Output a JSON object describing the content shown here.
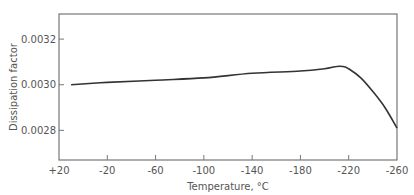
{
  "chart_data": {
    "type": "line",
    "title": "",
    "xlabel": "Temperature, °C",
    "ylabel": "Dissipation factor",
    "x_ticks": [
      "+20",
      "-20",
      "-60",
      "-100",
      "-140",
      "-180",
      "-220",
      "-260"
    ],
    "x_tick_values": [
      20,
      -20,
      -60,
      -100,
      -140,
      -180,
      -220,
      -260
    ],
    "y_ticks": [
      "0.0028",
      "0.0030",
      "0.0032"
    ],
    "y_tick_values": [
      0.0028,
      0.003,
      0.0032
    ],
    "xlim": [
      20,
      -260
    ],
    "ylim": [
      0.00267,
      0.00331
    ],
    "grid": false,
    "legend": null,
    "series": [
      {
        "name": "Dissipation factor",
        "x": [
          10,
          -20,
          -60,
          -100,
          -140,
          -180,
          -200,
          -210,
          -215,
          -220,
          -230,
          -240,
          -250,
          -260
        ],
        "values": [
          0.003,
          0.00301,
          0.00302,
          0.00303,
          0.00305,
          0.00306,
          0.00307,
          0.00308,
          0.00308,
          0.00307,
          0.00303,
          0.00297,
          0.0029,
          0.00281
        ]
      }
    ]
  }
}
